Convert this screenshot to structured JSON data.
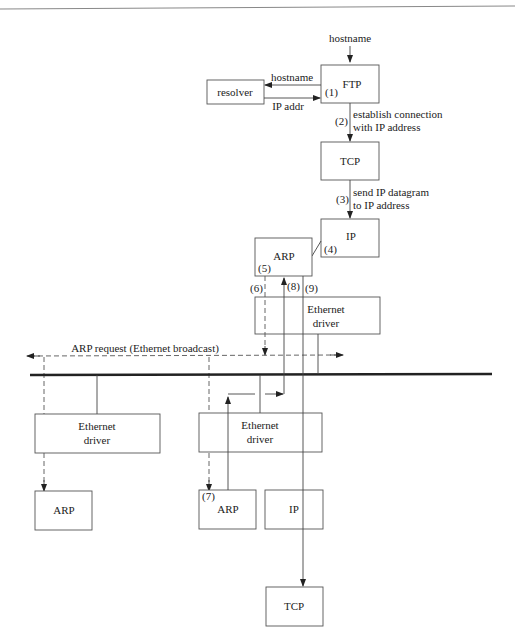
{
  "diagram": {
    "type": "protocol-flow",
    "top_input": "hostname",
    "boxes": {
      "ftp": "FTP",
      "resolver": "resolver",
      "tcp_top": "TCP",
      "ip_top": "IP",
      "arp_top": "ARP",
      "eth_top_1": "Ethernet",
      "eth_top_2": "driver",
      "eth_left_1": "Ethernet",
      "eth_left_2": "driver",
      "arp_left": "ARP",
      "eth_right_1": "Ethernet",
      "eth_right_2": "driver",
      "arp_right": "ARP",
      "ip_right": "IP",
      "tcp_bottom": "TCP"
    },
    "labels": {
      "to_resolver": "hostname",
      "from_resolver": "IP addr",
      "step1": "(1)",
      "step2": "(2)",
      "step2_text_1": "establish connection",
      "step2_text_2": "with IP address",
      "step3": "(3)",
      "step3_text_1": "send IP datagram",
      "step3_text_2": "to IP address",
      "step4": "(4)",
      "step5": "(5)",
      "step6": "(6)",
      "step7": "(7)",
      "step8": "(8)",
      "step9": "(9)",
      "broadcast": "ARP request (Ethernet broadcast)"
    }
  }
}
